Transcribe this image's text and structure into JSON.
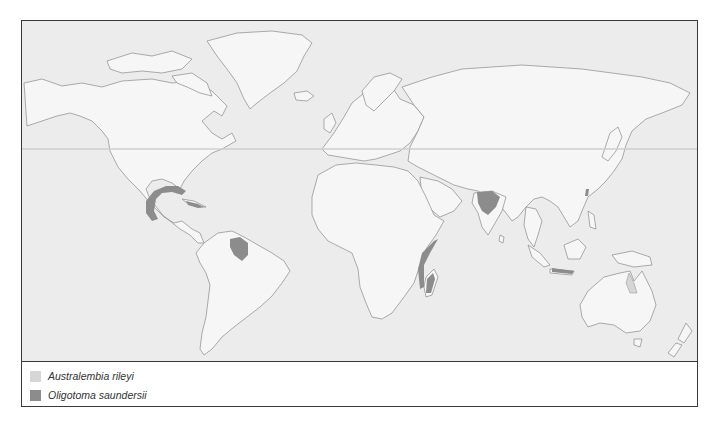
{
  "map": {
    "title": "",
    "colors": {
      "ocean": "#ececec",
      "land": "#f6f6f6",
      "coast": "#8a8a8a",
      "australembia_rileyi": "#d6d6d6",
      "oligotoma_saundersii": "#8c8c8c"
    },
    "regions": [
      {
        "species": "Oligotoma saundersii",
        "area": "Gulf of Mexico coast (Mexico / southern USA)"
      },
      {
        "species": "Oligotoma saundersii",
        "area": "Cuba"
      },
      {
        "species": "Oligotoma saundersii",
        "area": "Northern South America (Venezuela / Guyana)"
      },
      {
        "species": "Oligotoma saundersii",
        "area": "East African coast"
      },
      {
        "species": "Oligotoma saundersii",
        "area": "Madagascar"
      },
      {
        "species": "Oligotoma saundersii",
        "area": "Indian subcontinent"
      },
      {
        "species": "Oligotoma saundersii",
        "area": "Taiwan"
      },
      {
        "species": "Oligotoma saundersii",
        "area": "Java / Lesser Sunda Islands"
      },
      {
        "species": "Australembia rileyi",
        "area": "Cape York, northeastern Australia"
      }
    ]
  },
  "legend": {
    "items": [
      {
        "label": "Australembia rileyi",
        "color": "#d6d6d6"
      },
      {
        "label": "Oligotoma saundersii",
        "color": "#8c8c8c"
      }
    ]
  }
}
